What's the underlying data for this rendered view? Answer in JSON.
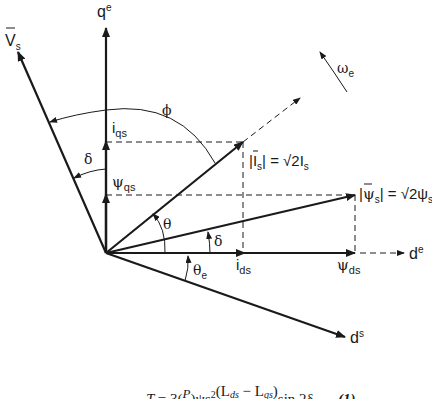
{
  "diagram": {
    "origin": [
      106,
      253
    ],
    "colors": {
      "stroke": "#1a1a1a",
      "background": "#ffffff"
    },
    "axes": {
      "qe": {
        "label": "q",
        "sup": "e"
      },
      "de": {
        "label": "d",
        "sup": "e"
      },
      "ds": {
        "label": "d",
        "sup": "s"
      }
    },
    "vectors": {
      "Vs": {
        "label": "V",
        "sub": "s",
        "bar": true
      },
      "Is": {
        "label_left": "|",
        "label_sym": "I",
        "sub": "s",
        "label_rest": "| = √2I",
        "sub2": "s"
      },
      "psis": {
        "label_left": "|",
        "label_sym": "ψ",
        "sub": "s",
        "label_rest": "| = √2ψ",
        "sub2": "s"
      }
    },
    "components": {
      "iqs": {
        "label": "i",
        "sub": "qs"
      },
      "psiqs": {
        "label": "ψ",
        "sub": "qs"
      },
      "ids": {
        "label": "i",
        "sub": "ds"
      },
      "psids": {
        "label": "ψ",
        "sub": "ds"
      }
    },
    "angles": {
      "phi": "ϕ",
      "delta_upper": "δ",
      "theta": "θ",
      "delta_lower": "δ",
      "theta_e": {
        "label": "θ",
        "sub": "e"
      }
    },
    "rotation": {
      "label": "ω",
      "sub": "e"
    },
    "equation": {
      "text": "T = 3(P/2)ψ²(L_ds − L_qs) sin 2δ",
      "lhs": "T",
      "eq_sign": "= 3(",
      "p": "P",
      "mid": ")ψs",
      "sup": "2",
      "frac_num": "(L",
      "ds": "ds",
      "minus": " − L",
      "qs": "qs",
      "close": ")",
      "sin": "sin 2δ",
      "number": "(1)"
    }
  }
}
